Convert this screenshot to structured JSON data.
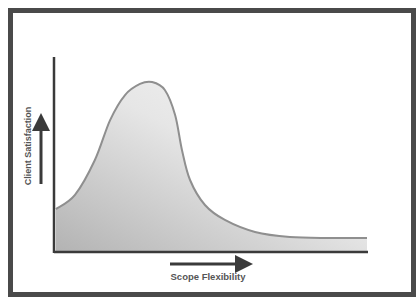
{
  "chart_data": {
    "type": "area",
    "title": "",
    "xlabel": "Scope Flexibility",
    "ylabel": "Client Satisfaction",
    "xlim": [
      0,
      1
    ],
    "ylim": [
      0,
      1
    ],
    "grid": false,
    "legend": "none",
    "ticks": "none",
    "series": [
      {
        "name": "Client Satisfaction vs Scope Flexibility",
        "x": [
          0,
          0.061,
          0.125,
          0.174,
          0.222,
          0.27,
          0.309,
          0.35,
          0.383,
          0.405,
          0.431,
          0.479,
          0.543,
          0.64,
          0.752,
          0.881,
          1
        ],
        "y": [
          0.216,
          0.289,
          0.469,
          0.675,
          0.804,
          0.861,
          0.871,
          0.83,
          0.701,
          0.521,
          0.366,
          0.237,
          0.16,
          0.098,
          0.072,
          0.067,
          0.067
        ]
      }
    ],
    "colors": {
      "line": "#8f8f8f",
      "fill_dark": "#b5b5b5",
      "fill_light": "#f2f2f2",
      "axis": "#3a3a3a",
      "frame": "#4a4a4a",
      "text": "#555555"
    }
  }
}
